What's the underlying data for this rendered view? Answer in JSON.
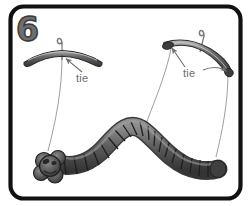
{
  "panel": {
    "step_number": "6",
    "border_color": "#111111",
    "background_color": "#ffffff"
  },
  "labels": [
    {
      "id": "tie-left",
      "text": "tie",
      "color": "#6b6b6b"
    },
    {
      "id": "tie-right",
      "text": "tie",
      "color": "#6b6b6b"
    }
  ],
  "objects": {
    "hanger_left": {
      "name": "coat-hanger-left",
      "orientation": "horizontal",
      "bar_color": "#4a4a4a",
      "highlight_color": "#b9b9b9",
      "hook_color": "#777777"
    },
    "hanger_right": {
      "name": "coat-hanger-right",
      "orientation": "tilted",
      "bar_color": "#4a4a4a",
      "highlight_color": "#b9b9b9",
      "hook_color": "#777777"
    },
    "caterpillar": {
      "name": "segmented-caterpillar-puppet",
      "segment_count": "22",
      "body_color": "#5a5a5a",
      "shadow_color": "#3a3a3a",
      "highlight_color": "#9a9a9a"
    },
    "strings": {
      "name": "puppet-strings",
      "count": "3",
      "color": "#8a8a8a"
    }
  },
  "annotations": {
    "arrow_color": "#777777",
    "arrow_left_count": "1",
    "arrow_right_count": "2"
  }
}
